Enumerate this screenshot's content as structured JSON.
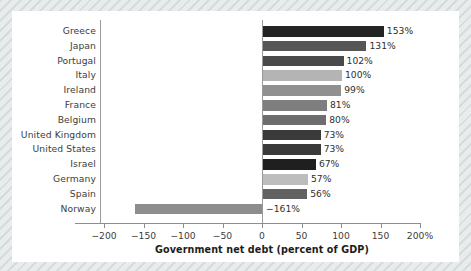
{
  "chart_data": {
    "type": "bar",
    "orientation": "horizontal",
    "title": "",
    "xlabel": "Government net debt (percent of GDP)",
    "ylabel": "",
    "xlim": [
      -200,
      200
    ],
    "xticks": [
      -200,
      -150,
      -100,
      -50,
      0,
      50,
      100,
      150,
      200
    ],
    "xticklabels": [
      "−200",
      "−150",
      "−100",
      "−50",
      "0",
      "50",
      "100",
      "150",
      "200%"
    ],
    "grid": false,
    "legend": null,
    "categories": [
      "Greece",
      "Japan",
      "Portugal",
      "Italy",
      "Ireland",
      "France",
      "Belgium",
      "United Kingdom",
      "United States",
      "Israel",
      "Germany",
      "Spain",
      "Norway"
    ],
    "values": [
      153,
      131,
      102,
      100,
      99,
      81,
      80,
      73,
      73,
      67,
      57,
      56,
      -161
    ],
    "value_labels": [
      "153%",
      "131%",
      "102%",
      "100%",
      "99%",
      "81%",
      "80%",
      "73%",
      "73%",
      "67%",
      "57%",
      "56%",
      "−161%"
    ],
    "bar_colors": [
      "#242424",
      "#565656",
      "#4a4a4a",
      "#b4b4b4",
      "#909090",
      "#7e7e7e",
      "#6d6d6d",
      "#3a3a3a",
      "#3a3a3a",
      "#1f1f1f",
      "#bdbdbd",
      "#616161",
      "#8d8d8d"
    ]
  },
  "colors": {
    "page_background": "#e9ecec",
    "card_background": "#ffffff",
    "axis": "#8e8e8e",
    "text": "#3d3d3d",
    "label_text": "#1c1c1c"
  }
}
